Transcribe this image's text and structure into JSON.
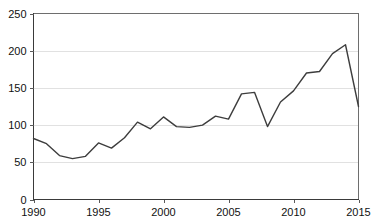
{
  "chart_data": {
    "type": "line",
    "title": "",
    "subtitle": "",
    "xlabel": "",
    "ylabel": "",
    "xlim": [
      1990,
      2015
    ],
    "ylim": [
      0,
      250
    ],
    "grid": true,
    "legend": null,
    "x_ticks": [
      1990,
      1995,
      2000,
      2005,
      2010,
      2015
    ],
    "y_ticks": [
      0,
      50,
      100,
      150,
      200,
      250
    ],
    "x": [
      1990,
      1991,
      1992,
      1993,
      1994,
      1995,
      1996,
      1997,
      1998,
      1999,
      2000,
      2001,
      2002,
      2003,
      2004,
      2005,
      2006,
      2007,
      2008,
      2009,
      2010,
      2011,
      2012,
      2013,
      2014,
      2015
    ],
    "series": [
      {
        "name": "series-1",
        "color": "#3d3d3d",
        "values": [
          82,
          75,
          59,
          55,
          58,
          76,
          69,
          83,
          104,
          95,
          111,
          98,
          97,
          100,
          112,
          108,
          142,
          144,
          98,
          131,
          146,
          170,
          172,
          196,
          208,
          125
        ]
      }
    ],
    "axis_color": "#3a3a3a",
    "grid_color": "#d9d9d9",
    "frame_color": "#6e6e6e",
    "background": "#ffffff"
  },
  "axis_labels": {
    "y": [
      "250",
      "200",
      "150",
      "100",
      "50",
      "0"
    ],
    "x": [
      "1990",
      "1995",
      "2000",
      "2005",
      "2010",
      "2015"
    ]
  }
}
